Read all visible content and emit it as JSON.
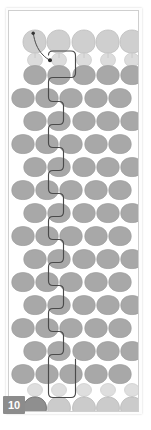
{
  "panel": {
    "kind": "slide-thumbnail",
    "page_badge_label": "10",
    "badge_color": "#8c8c8c",
    "badge_text_color": "#ffffff",
    "frame_border_color": "#cfcfcf",
    "background_color": "#ffffff"
  },
  "artwork": {
    "title": "grid-of-apple-shapes",
    "shape_name": "apple-shape",
    "columns": 5,
    "rows": 18,
    "col_pitch": 24.5,
    "row_pitch": 23.2,
    "origin_x": 6,
    "origin_y": 6,
    "palette": {
      "top_row_fill": "#cfcfcf",
      "top_row_stroke": "#b9b9b9",
      "body_fill": "#a8a8a8",
      "body_stroke": "#9a9a9a",
      "bottom_row_fill": "#cbcbcb",
      "bottom_row_stroke": "#b5b5b5",
      "highlight_fill": "#8f8f8f",
      "highlight_stroke": "#777777",
      "stem_color": "#bdbdbd",
      "path_outline_color": "#4a4a4a",
      "pointer_color": "#3a3a3a"
    },
    "rows_meta": [
      {
        "index": 0,
        "style": "light-large",
        "label": "top-light-row"
      },
      {
        "index": 1,
        "style": "light-small",
        "label": "top-small-row"
      },
      {
        "index": 2,
        "style": "body",
        "label": "body-row"
      },
      {
        "index": 3,
        "style": "body",
        "label": "body-row"
      },
      {
        "index": 4,
        "style": "body",
        "label": "body-row"
      },
      {
        "index": 5,
        "style": "body",
        "label": "body-row"
      },
      {
        "index": 6,
        "style": "body",
        "label": "body-row"
      },
      {
        "index": 7,
        "style": "body",
        "label": "body-row"
      },
      {
        "index": 8,
        "style": "body",
        "label": "body-row"
      },
      {
        "index": 9,
        "style": "body",
        "label": "body-row"
      },
      {
        "index": 10,
        "style": "body",
        "label": "body-row"
      },
      {
        "index": 11,
        "style": "body",
        "label": "body-row"
      },
      {
        "index": 12,
        "style": "body",
        "label": "body-row"
      },
      {
        "index": 13,
        "style": "body",
        "label": "body-row"
      },
      {
        "index": 14,
        "style": "body",
        "label": "body-row"
      },
      {
        "index": 15,
        "style": "body",
        "label": "body-row"
      },
      {
        "index": 16,
        "style": "light-small",
        "label": "bottom-small-row"
      },
      {
        "index": 17,
        "style": "light-large",
        "label": "bottom-light-row"
      }
    ],
    "highlighted_cell": {
      "row": 17,
      "col": 0,
      "label": "selected-apple"
    },
    "selection_path": {
      "label": "serpentine-selection-outline",
      "stroke_color": "#4a4a4a",
      "stroke_width": 1.2,
      "spans_rows": [
        1,
        17
      ],
      "spans_cols": [
        0,
        1
      ]
    },
    "pointer_annotation": {
      "label": "curved-pointer",
      "start": {
        "x": 24,
        "y": 22
      },
      "end": {
        "x": 40,
        "y": 48
      },
      "dot_radius": 1.6
    }
  }
}
